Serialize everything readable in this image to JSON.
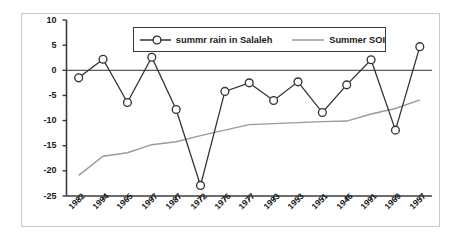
{
  "chart_data": {
    "type": "line",
    "title": "",
    "xlabel": "",
    "ylabel": "Normalized anomalies *(10)",
    "categories": [
      "1982",
      "1994",
      "1965",
      "1997",
      "1987",
      "1972",
      "1976",
      "1977",
      "1993",
      "1953",
      "1951",
      "1946",
      "1991",
      "1969",
      "1957"
    ],
    "ylim": [
      -25,
      10
    ],
    "yticks": [
      10,
      5,
      0,
      -5,
      -10,
      -15,
      -20,
      -25
    ],
    "ytick_labels": [
      "10",
      "5",
      "0",
      "-5",
      "-10",
      "-15",
      "-20",
      "-25"
    ],
    "grid": false,
    "legend_position": "top-center",
    "zero_line": true,
    "series": [
      {
        "name": "summr rain in Salaleh",
        "marker": "open-circle",
        "color": "#333333",
        "values": [
          -1.5,
          2.2,
          -6.4,
          2.6,
          -7.8,
          -22.9,
          -4.2,
          -2.5,
          -6.0,
          -2.3,
          -8.4,
          -2.9,
          2.1,
          -11.9,
          4.7
        ]
      },
      {
        "name": "Summer SOI",
        "marker": "none",
        "color": "#9a9a9a",
        "values": [
          -20.9,
          -17.1,
          -16.4,
          -14.8,
          -14.2,
          -13.0,
          -11.9,
          -10.8,
          -10.6,
          -10.4,
          -10.2,
          -10.1,
          -8.7,
          -7.6,
          -5.9
        ]
      }
    ]
  },
  "legend": {
    "entry_1": "summr rain in Salaleh",
    "entry_2": "Summer SOI"
  }
}
